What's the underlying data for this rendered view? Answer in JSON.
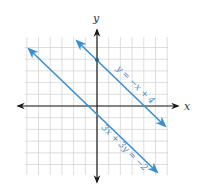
{
  "graph": {
    "x_axis_label": "x",
    "y_axis_label": "y",
    "grid": {
      "xmin": -6,
      "xmax": 6,
      "ymin": -6,
      "ymax": 6,
      "step": 1
    },
    "line_color": "#3a8fd0",
    "grid_color": "#d6d6d6",
    "axis_color": "#1a1a1a",
    "lines": [
      {
        "equation": "y = −x + 4",
        "slope": -1,
        "intercept": 4,
        "label_rotation": 45
      },
      {
        "equation": "3x + 3y = −2",
        "slope": -1,
        "intercept": -0.6667,
        "label_rotation": 45
      }
    ],
    "points": [
      {
        "x": 0,
        "y": 4,
        "label": "y-intercept of y = −x + 4"
      }
    ]
  }
}
